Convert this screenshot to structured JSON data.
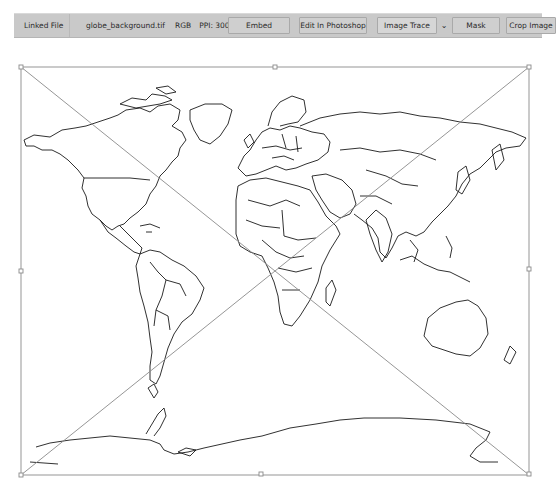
{
  "control_bar": {
    "linked_file_label": "Linked File",
    "file_name": "globe_background.tif",
    "color_mode": "RGB",
    "ppi": "PPI: 300",
    "buttons": {
      "embed": "Embed",
      "edit_in_photoshop": "Edit In Photoshop",
      "image_trace": "Image Trace",
      "image_trace_dropdown": "⌄",
      "mask": "Mask",
      "crop_image": "Crop Image"
    }
  },
  "artboard": {
    "placed_image": "world map outline (political boundaries)",
    "selection": {
      "type": "placed-image bounding box with X cross",
      "handles": [
        "top-left",
        "top-center",
        "top-right",
        "middle-left",
        "middle-right",
        "bottom-left",
        "bottom-center",
        "bottom-right"
      ],
      "stroke_color": "#8a8a8a"
    },
    "map_stroke_color": "#1a1a1a"
  }
}
